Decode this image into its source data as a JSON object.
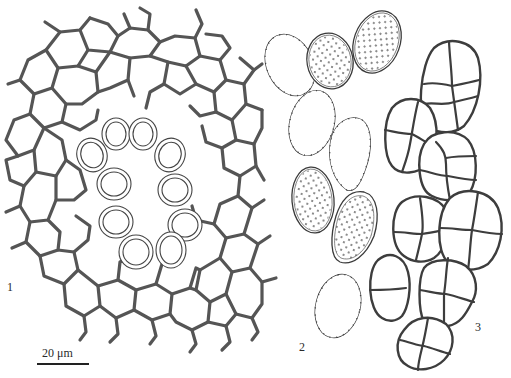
{
  "figure": {
    "panels": [
      {
        "id": "1",
        "label": "1",
        "description": "cellular network with ring of ten double-walled oval cells"
      },
      {
        "id": "2",
        "label": "2",
        "description": "eight ellipsoid punctate spores with spiny wall"
      },
      {
        "id": "3",
        "label": "3",
        "description": "ten muriform septate spores"
      }
    ],
    "scale_bar": {
      "label": "20 μm"
    },
    "colors": {
      "ink": "#333333",
      "background": "#ffffff"
    }
  }
}
